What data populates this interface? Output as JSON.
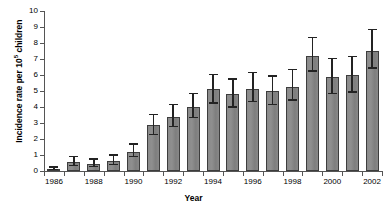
{
  "chart_data": {
    "type": "bar",
    "title": "",
    "xlabel": "Year",
    "ylabel": "Incidence rate per 10⁵ children",
    "ylabel_base": "Incidence rate per 10",
    "ylabel_sup": "5",
    "ylabel_tail": " children",
    "ylim": [
      0,
      10
    ],
    "yticks": [
      0,
      1,
      2,
      3,
      4,
      5,
      6,
      7,
      8,
      9,
      10
    ],
    "ytick_labels": [
      "0",
      "1",
      "2",
      "3",
      "4",
      "5",
      "6",
      "7",
      "8",
      "9",
      "10"
    ],
    "grid": false,
    "legend": "none",
    "bar_color": "#888888",
    "bar_edge_color": "#3d3d3d",
    "error_bar_color": "#232323",
    "axis_color": "#555555",
    "categories": [
      "1986",
      "1987",
      "1988",
      "1989",
      "1990",
      "1991",
      "1992",
      "1993",
      "1994",
      "1995",
      "1996",
      "1997",
      "1998",
      "1999",
      "2000",
      "2001",
      "2002"
    ],
    "xtick_labels": [
      "1986",
      "1988",
      "1990",
      "1992",
      "1994",
      "1996",
      "1998",
      "2000",
      "2002"
    ],
    "values": [
      0.1,
      0.55,
      0.45,
      0.6,
      1.2,
      2.85,
      3.35,
      4.0,
      5.1,
      4.8,
      5.15,
      5.0,
      5.25,
      7.2,
      5.9,
      6.0,
      7.5
    ],
    "error_low": [
      0.05,
      0.3,
      0.25,
      0.35,
      0.85,
      2.25,
      2.75,
      3.3,
      4.2,
      3.95,
      4.3,
      4.1,
      4.4,
      6.2,
      4.8,
      4.9,
      6.4
    ],
    "error_high": [
      0.2,
      0.85,
      0.7,
      0.95,
      1.65,
      3.5,
      4.1,
      4.8,
      6.0,
      5.7,
      6.1,
      5.9,
      6.3,
      8.3,
      7.0,
      7.1,
      8.8
    ]
  }
}
